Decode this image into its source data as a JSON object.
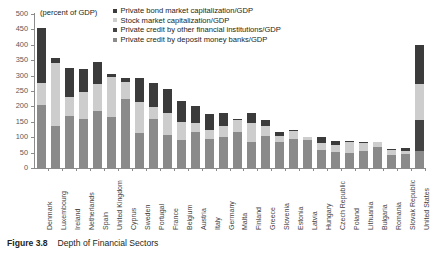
{
  "caption": {
    "figure_number": "Figure 3.8",
    "title": "Depth of Financial Sectors"
  },
  "axis_unit_label": "(percent of GDP)",
  "colors": {
    "private_bond": "#3b3b3b",
    "stock_market": "#cdcdcd",
    "other_financial": "#434343",
    "deposit_banks": "#8a8a8a",
    "axis": "#8b8b8b",
    "text": "#231f20"
  },
  "legend": {
    "items": [
      {
        "label": "Private bond market capitalization/GDP",
        "color": "#3b3b3b",
        "key": "private_bond"
      },
      {
        "label": "Stock market capitalization/GDP",
        "color": "#cdcdcd",
        "key": "stock_market"
      },
      {
        "label": "Private credit by other financial institutions/GDP",
        "color": "#434343",
        "key": "other_financial"
      },
      {
        "label": "Private credit by deposit money banks/GDP",
        "color": "#8a8a8a",
        "key": "deposit_banks"
      }
    ]
  },
  "chart_data": {
    "type": "bar",
    "stacked": true,
    "title": "Depth of Financial Sectors",
    "xlabel": "",
    "ylabel": "(percent of GDP)",
    "ylim": [
      0,
      500
    ],
    "yticks": [
      0,
      50,
      100,
      150,
      200,
      250,
      300,
      350,
      400,
      450,
      500
    ],
    "grid": false,
    "legend_position": "top-right",
    "categories": [
      "Denmark",
      "Luxembourg",
      "Ireland",
      "Netherlands",
      "Spain",
      "United Kingdom",
      "Cyprus",
      "Sweden",
      "Portugal",
      "France",
      "Belgium",
      "Austria",
      "Italy",
      "Germany",
      "Malta",
      "Finland",
      "Greece",
      "Slovenia",
      "Estonia",
      "Latvia",
      "Hungary",
      "Czech Republic",
      "Poland",
      "Lithuania",
      "Bulgaria",
      "Romania",
      "Slovak Republic",
      "United States"
    ],
    "series": [
      {
        "name": "Private credit by deposit money banks/GDP",
        "key": "deposit_banks",
        "color": "#8a8a8a",
        "values": [
          203,
          135,
          170,
          160,
          185,
          167,
          225,
          115,
          160,
          108,
          90,
          117,
          95,
          100,
          118,
          85,
          105,
          85,
          95,
          90,
          60,
          53,
          50,
          55,
          68,
          42,
          45,
          55
        ]
      },
      {
        "name": "Private credit by other financial institutions/GDP",
        "key": "other_financial",
        "color": "#434343",
        "values": [
          0,
          0,
          0,
          0,
          0,
          0,
          0,
          0,
          0,
          0,
          0,
          0,
          0,
          0,
          0,
          0,
          0,
          0,
          0,
          0,
          0,
          0,
          0,
          0,
          0,
          0,
          0,
          100
        ]
      },
      {
        "name": "Stock market capitalization/GDP",
        "key": "stock_market",
        "color": "#cdcdcd",
        "values": [
          72,
          205,
          60,
          88,
          88,
          130,
          55,
          98,
          37,
          70,
          60,
          28,
          30,
          38,
          38,
          60,
          30,
          20,
          25,
          10,
          22,
          22,
          33,
          27,
          15,
          18,
          9,
          118
        ]
      },
      {
        "name": "Private bond market capitalization/GDP",
        "key": "private_bond",
        "color": "#3b3b3b",
        "values": [
          180,
          18,
          95,
          75,
          72,
          8,
          12,
          80,
          78,
          80,
          68,
          55,
          52,
          40,
          3,
          33,
          20,
          13,
          2,
          2,
          20,
          12,
          5,
          3,
          2,
          2,
          12,
          128
        ]
      }
    ],
    "totals": [
      455,
      358,
      325,
      323,
      345,
      305,
      292,
      293,
      275,
      258,
      218,
      200,
      177,
      178,
      159,
      178,
      155,
      118,
      122,
      102,
      102,
      87,
      88,
      85,
      85,
      62,
      66,
      401
    ]
  }
}
